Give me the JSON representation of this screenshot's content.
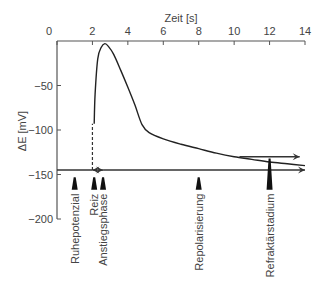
{
  "chart_data": {
    "type": "line",
    "title": "",
    "xlabel": "Zeit [s]",
    "ylabel": "ΔE  [mV]",
    "xlim": [
      0,
      14
    ],
    "ylim": [
      -200,
      0
    ],
    "x_ticks": [
      0,
      2,
      4,
      6,
      8,
      10,
      12,
      14
    ],
    "x_tick_labels": [
      "0",
      "2",
      "4",
      "6",
      "8",
      "10",
      "12",
      "14"
    ],
    "y_ticks": [
      -50,
      -100,
      -150,
      -200
    ],
    "y_tick_labels": [
      "−50",
      "−100",
      "−150",
      "−200"
    ],
    "x_axis_position": "top",
    "grid": false,
    "series": [
      {
        "name": "Aktionspotenzial",
        "x": [
          2.1,
          2.15,
          2.3,
          2.5,
          2.7,
          2.9,
          3.2,
          3.6,
          4.0,
          4.4,
          4.8,
          5.2,
          6.0,
          7.0,
          8.0,
          9.0,
          10.0,
          11.0,
          12.0,
          13.0,
          14.0
        ],
        "y": [
          -93,
          -60,
          -20,
          -7,
          -3,
          -6,
          -15,
          -33,
          -52,
          -72,
          -94,
          -103,
          -110,
          -116,
          -121,
          -126,
          -130,
          -133,
          -136,
          -138,
          -140
        ]
      }
    ],
    "resting_potential": -145,
    "stimulus_time": 2.0,
    "stimulus_dashed_line": {
      "x": 2.0,
      "from_y": -145,
      "to_y": -93
    },
    "annotations": [
      {
        "label": "Ruhepotenzial",
        "x": 1.0
      },
      {
        "label": "Reiz",
        "x": 2.1
      },
      {
        "label": "Anstiegsphase",
        "x": 2.6
      },
      {
        "label": "Repolarisierung",
        "x": 8.0
      },
      {
        "label": "Refraktärstadium",
        "x": 12.0
      }
    ],
    "arrows": [
      {
        "from_x": 2.0,
        "to_x": 2.6,
        "y": -145,
        "type": "double"
      },
      {
        "from_x": 2.6,
        "to_x": 14.0,
        "y": -145,
        "type": "right"
      },
      {
        "from_x": 10.3,
        "to_x": 13.7,
        "y": -130,
        "type": "right"
      }
    ]
  },
  "labels": {
    "x_axis_title": "Zeit [s]",
    "y_axis_title": "ΔE  [mV]"
  }
}
